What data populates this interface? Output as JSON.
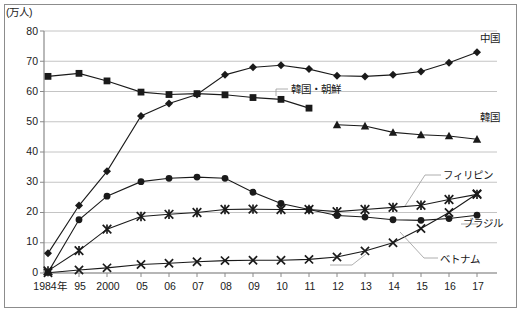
{
  "chart_data": {
    "type": "line",
    "title": "",
    "subtitle": "",
    "xlabel": "",
    "ylabel": "",
    "unit_label": "(万人)",
    "grid": true,
    "legend_position": "inline-right",
    "ylim": [
      0,
      80
    ],
    "yticks": [
      0,
      10,
      20,
      30,
      40,
      50,
      60,
      70,
      80
    ],
    "categories": [
      "1984年",
      "95",
      "2000",
      "05",
      "06",
      "07",
      "08",
      "09",
      "10",
      "11",
      "12",
      "13",
      "14",
      "15",
      "16",
      "17"
    ],
    "x": [
      1984,
      1995,
      2000,
      2005,
      2006,
      2007,
      2008,
      2009,
      2010,
      2011,
      2012,
      2013,
      2014,
      2015,
      2016,
      2017
    ],
    "series": [
      {
        "name": "中国",
        "marker": "diamond",
        "color": "#1a1a1a",
        "values": [
          6.5,
          22.3,
          33.6,
          51.9,
          56.0,
          59.0,
          65.5,
          68.0,
          68.7,
          67.4,
          65.2,
          65.0,
          65.5,
          66.6,
          69.5,
          73.0
        ]
      },
      {
        "name": "韓国・朝鮮",
        "marker": "square",
        "color": "#1a1a1a",
        "values": [
          65.0,
          66.0,
          63.5,
          59.8,
          59.0,
          59.3,
          58.9,
          58.0,
          57.4,
          54.5,
          null,
          null,
          null,
          null,
          null,
          null
        ]
      },
      {
        "name": "韓国",
        "marker": "triangle",
        "color": "#1a1a1a",
        "values": [
          null,
          null,
          null,
          null,
          null,
          null,
          null,
          null,
          null,
          null,
          49.0,
          48.6,
          46.5,
          45.7,
          45.3,
          44.2
        ]
      },
      {
        "name": "フィリピン",
        "marker": "asterisk",
        "color": "#1a1a1a",
        "values": [
          0.7,
          7.4,
          14.5,
          18.7,
          19.4,
          20.0,
          21.0,
          21.1,
          21.0,
          21.0,
          20.3,
          21.0,
          21.7,
          22.4,
          24.3,
          26.0
        ]
      },
      {
        "name": "ブラジル",
        "marker": "circle",
        "color": "#1a1a1a",
        "values": [
          0.2,
          17.6,
          25.4,
          30.2,
          31.3,
          31.7,
          31.3,
          26.7,
          23.0,
          21.0,
          19.0,
          18.5,
          17.6,
          17.4,
          18.0,
          19.1
        ]
      },
      {
        "name": "ベトナム",
        "marker": "cross",
        "color": "#1a1a1a",
        "values": [
          0.1,
          1.0,
          1.7,
          2.8,
          3.2,
          3.7,
          4.1,
          4.2,
          4.2,
          4.5,
          5.3,
          7.3,
          10.0,
          14.7,
          20.0,
          26.2
        ]
      }
    ],
    "annotations": [
      {
        "text": "中国",
        "series": "中国"
      },
      {
        "text": "韓国・朝鮮",
        "series": "韓国・朝鮮"
      },
      {
        "text": "韓国",
        "series": "韓国"
      },
      {
        "text": "フィリピン",
        "series": "フィリピン"
      },
      {
        "text": "ブラジル",
        "series": "ブラジル"
      },
      {
        "text": "ベトナム",
        "series": "ベトナム"
      }
    ]
  },
  "labels": {
    "unit": "(万人)",
    "y0": "0",
    "y10": "10",
    "y20": "20",
    "y30": "30",
    "y40": "40",
    "y50": "50",
    "y60": "60",
    "y70": "70",
    "y80": "80",
    "x0": "1984年",
    "x1": "95",
    "x2": "2000",
    "x3": "05",
    "x4": "06",
    "x5": "07",
    "x6": "08",
    "x7": "09",
    "x8": "10",
    "x9": "11",
    "x10": "12",
    "x11": "13",
    "x12": "14",
    "x13": "15",
    "x14": "16",
    "x15": "17",
    "s_china": "中国",
    "s_korea_old": "韓国・朝鮮",
    "s_korea": "韓国",
    "s_philippines": "フィリピン",
    "s_brazil": "ブラジル",
    "s_vietnam": "ベトナム"
  }
}
